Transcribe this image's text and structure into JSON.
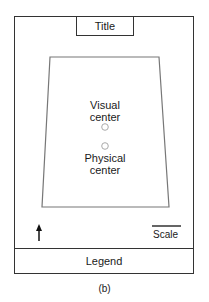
{
  "figure": {
    "title": "Title",
    "visual_center_label_line1": "Visual",
    "visual_center_label_line2": "center",
    "physical_center_label_line1": "Physical",
    "physical_center_label_line2": "center",
    "scale_label": "Scale",
    "legend_label": "Legend",
    "caption": "(b)",
    "north_arrow_icon": "north-arrow-icon",
    "colors": {
      "frame": "#333333",
      "map_outline": "#777777",
      "center_marker": "#aaaaaa"
    }
  }
}
